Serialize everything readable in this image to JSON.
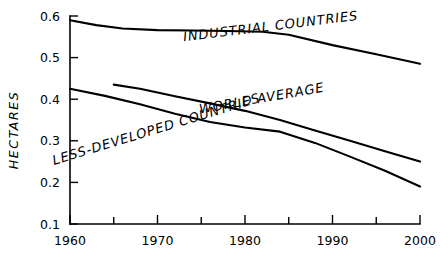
{
  "chart_data": {
    "type": "line",
    "title": "",
    "subtitle": "",
    "xlabel": "",
    "ylabel": "HECTARES",
    "xlim": [
      1960,
      2000
    ],
    "ylim": [
      0.1,
      0.6
    ],
    "grid": false,
    "legend_position": "inline-on-curves",
    "x_major_ticks": [
      1960,
      1970,
      1980,
      1990,
      2000
    ],
    "x_minor_ticks": [
      1965,
      1975,
      1985,
      1995
    ],
    "x_tick_labels": [
      "1960",
      "1970",
      "1980",
      "1990",
      "2000"
    ],
    "y_ticks": [
      0.1,
      0.2,
      0.3,
      0.4,
      0.5,
      0.6
    ],
    "y_tick_labels": [
      "0.1",
      "0.2",
      "0.3",
      "0.4",
      "0.5",
      "0.6"
    ],
    "series": [
      {
        "name": "INDUSTRIAL COUNTRIES",
        "label_x": 1983,
        "label_y": 0.565,
        "label_rotation": -7,
        "x": [
          1960,
          1963,
          1966,
          1970,
          1974,
          1978,
          1982,
          1985,
          1990,
          1995,
          2000
        ],
        "values": [
          0.59,
          0.578,
          0.57,
          0.566,
          0.565,
          0.564,
          0.562,
          0.555,
          0.53,
          0.508,
          0.485
        ]
      },
      {
        "name": "WORLD AVERAGE",
        "label_x": 1982,
        "label_y": 0.392,
        "label_rotation": -10,
        "x": [
          1965,
          1968,
          1972,
          1976,
          1980,
          1984,
          1988,
          1992,
          1996,
          2000
        ],
        "values": [
          0.435,
          0.425,
          0.407,
          0.39,
          0.372,
          0.35,
          0.325,
          0.3,
          0.275,
          0.25
        ]
      },
      {
        "name": "LESS-DEVELOPED COUNTRIES",
        "label_x": 1970,
        "label_y": 0.318,
        "label_rotation": -17,
        "x": [
          1960,
          1964,
          1968,
          1972,
          1976,
          1980,
          1984,
          1988,
          1992,
          1996,
          2000
        ],
        "values": [
          0.425,
          0.408,
          0.388,
          0.365,
          0.345,
          0.332,
          0.322,
          0.295,
          0.262,
          0.228,
          0.19
        ]
      }
    ]
  },
  "colors": {
    "ink": "#000000",
    "background": "#ffffff"
  }
}
